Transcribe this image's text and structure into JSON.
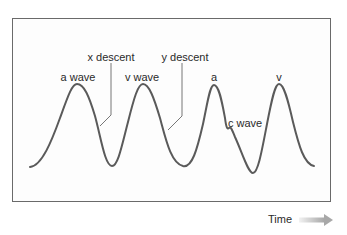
{
  "diagram": {
    "type": "waveform",
    "labels": {
      "a_wave": "a wave",
      "x_descent": "x descent",
      "v_wave": "v wave",
      "y_descent": "y descent",
      "a": "a",
      "c_wave": "c wave",
      "v": "v"
    },
    "axis": {
      "x_label": "Time"
    },
    "colors": {
      "curve": "#5a5a5a",
      "frame": "#6a6a6a",
      "leader": "#777777",
      "arrow_start": "#f2f2f2",
      "arrow_end": "#a8a8a8"
    }
  }
}
